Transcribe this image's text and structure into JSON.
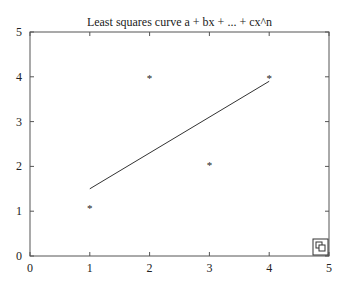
{
  "chart_data": {
    "type": "scatter",
    "title": "Least squares curve a + bx + ... + cx^n",
    "xlabel": "",
    "ylabel": "",
    "xlim": [
      0,
      5
    ],
    "ylim": [
      0,
      5
    ],
    "x_ticks": [
      "0",
      "1",
      "2",
      "3",
      "4",
      "5"
    ],
    "y_ticks": [
      "0",
      "1",
      "2",
      "3",
      "4",
      "5"
    ],
    "grid": false,
    "series": [
      {
        "name": "data points",
        "type": "scatter",
        "marker": "*",
        "x": [
          1,
          2,
          3,
          4
        ],
        "y": [
          1.1,
          4,
          2.05,
          4
        ]
      },
      {
        "name": "fit line",
        "type": "line",
        "x": [
          1,
          4
        ],
        "y": [
          1.5,
          3.9
        ]
      }
    ]
  },
  "ui": {
    "resize_icon": "window-resize-icon"
  }
}
